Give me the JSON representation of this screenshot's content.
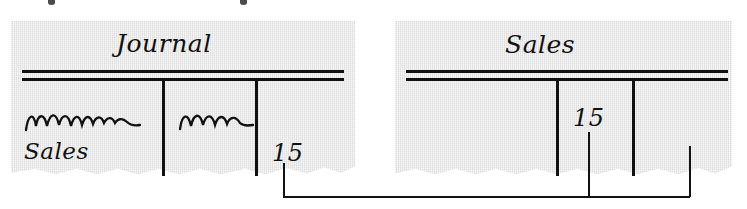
{
  "figure": {
    "type": "accounting-posting-diagram",
    "caption_visible": false,
    "paper_color": "#dedede",
    "ink_color": "#111111",
    "background": "#ffffff"
  },
  "top_artifacts": {
    "note": "cut-off descenders of a text line above the figure",
    "marks": [
      "descender-mark",
      "descender-mark"
    ]
  },
  "journal_page": {
    "name": "journal-page",
    "heading": "Journal",
    "rule_style": "double-rule",
    "columns": [
      {
        "name": "description-column",
        "content": "squiggle-handwriting"
      },
      {
        "name": "posting-reference-column",
        "content": "squiggle-handwriting"
      },
      {
        "name": "credit-amount-column",
        "content": "15"
      }
    ],
    "entries": [
      {
        "label": "squiggle-line-1",
        "text": "∿∿∿∿∿"
      },
      {
        "label": "squiggle-line-2",
        "text": "∿∿∿"
      },
      {
        "label": "account-credited",
        "text": "Sales"
      }
    ],
    "credit_amount": "15"
  },
  "ledger_page": {
    "name": "sales-ledger-page",
    "heading": "Sales",
    "rule_style": "double-rule",
    "columns": [
      {
        "name": "debit-side-column",
        "content": ""
      },
      {
        "name": "credit-amount-column",
        "content": "15"
      },
      {
        "name": "balance-column",
        "content": ""
      }
    ],
    "credit_amount": "15"
  },
  "connector": {
    "name": "posting-trace-line",
    "from": "journal credit amount 15",
    "to": "sales ledger credit 15",
    "style": "elbow-line"
  }
}
